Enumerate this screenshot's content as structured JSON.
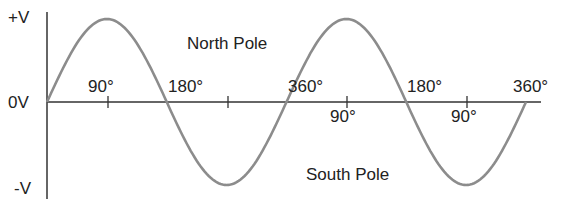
{
  "diagram": {
    "y_labels": {
      "positive": "+V",
      "zero": "0V",
      "negative": "-V"
    },
    "region_labels": {
      "north": "North Pole",
      "south": "South Pole"
    },
    "angle_labels": [
      {
        "text": "90°",
        "x": 88,
        "y": 78
      },
      {
        "text": "180°",
        "x": 168,
        "y": 78
      },
      {
        "text": "360°",
        "x": 288,
        "y": 78
      },
      {
        "text": "90°",
        "x": 330,
        "y": 108
      },
      {
        "text": "180°",
        "x": 407,
        "y": 78
      },
      {
        "text": "90°",
        "x": 451,
        "y": 108
      },
      {
        "text": "360°",
        "x": 513,
        "y": 78
      }
    ],
    "colors": {
      "wave": "#8c8c8c",
      "axis": "#333333",
      "text": "#222222"
    }
  },
  "chart_data": {
    "type": "line",
    "title": "",
    "xlabel": "Angle (degrees)",
    "ylabel": "Voltage",
    "x": [
      0,
      90,
      180,
      270,
      360,
      450,
      540,
      630,
      720
    ],
    "values": [
      0,
      1,
      0,
      -1,
      0,
      1,
      0,
      -1,
      0
    ],
    "y_ticks": [
      "+V",
      "0V",
      "-V"
    ],
    "ylim": [
      -1,
      1
    ],
    "grid": false
  }
}
